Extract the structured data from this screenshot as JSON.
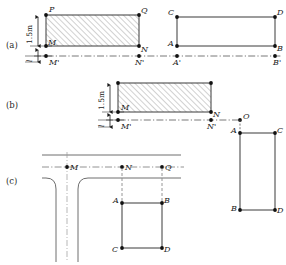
{
  "figure": {
    "background_color": "#ffffff",
    "stroke_color": "#3a3a3a",
    "hatch_color": "#8c8c8c",
    "node_color": "#111111",
    "centerline_color": "#555555",
    "road_color": "#6e6e6e"
  },
  "panels": [
    {
      "id": "a",
      "label": "(a)"
    },
    {
      "id": "b",
      "label": "(b)"
    },
    {
      "id": "c",
      "label": "(c)"
    }
  ],
  "panel_a": {
    "label": "(a)",
    "dimension_height": "1.5m",
    "dimension_offset": "l",
    "hatched_rect": {
      "corners": [
        "P",
        "Q",
        "M",
        "N"
      ],
      "labels": {
        "top_left": "P",
        "top_right": "Q",
        "bottom_left": "M",
        "bottom_right": "N"
      },
      "hatched": true
    },
    "baseline_points": {
      "left": "M'",
      "right": "N'"
    },
    "plain_rect": {
      "corners": [
        "C",
        "D",
        "A",
        "B"
      ],
      "labels": {
        "top_left": "C",
        "top_right": "D",
        "bottom_left": "A",
        "bottom_right": "B"
      },
      "hatched": false
    },
    "plain_baseline_points": {
      "left": "A'",
      "right": "B'"
    }
  },
  "panel_b": {
    "label": "(b)",
    "dimension_height": "1.5m",
    "dimension_offset": "l",
    "hatched_rect": {
      "labels": {
        "bottom_left": "M",
        "bottom_right": "N"
      },
      "hatched": true
    },
    "baseline_points": {
      "left": "M'",
      "right": "N'"
    },
    "origin_point": "O",
    "right_rect": {
      "labels": {
        "top_left": "A",
        "top_right": "C",
        "bottom_left": "B",
        "bottom_right": "D"
      },
      "hatched": false
    }
  },
  "panel_c": {
    "label": "(c)",
    "road_centerline_points": [
      "M",
      "N",
      "Q"
    ],
    "rect": {
      "labels": {
        "top_left": "A",
        "top_right": "B",
        "bottom_left": "C",
        "bottom_right": "D"
      },
      "hatched": false
    },
    "projection_lines": [
      {
        "from": "N",
        "to": "A"
      },
      {
        "from": "Q",
        "to": "B"
      }
    ]
  }
}
